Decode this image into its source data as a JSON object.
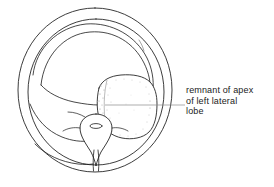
{
  "figure": {
    "type": "anatomical-line-drawing",
    "background_color": "#ffffff",
    "stroke_color": "#1a1a1a",
    "leader_line_color": "#8a8a8a",
    "stipple_color": "#9a9a9a",
    "canvas": {
      "width": 274,
      "height": 187
    }
  },
  "annotation": {
    "name": "remnant-of-apex-label",
    "lines": [
      "remnant of  apex",
      "of  left  lateral",
      "lobe"
    ],
    "full_text": "remnant of apex of left lateral lobe",
    "leader_line": {
      "from_x": 185,
      "to_x": 105,
      "y": 105
    }
  },
  "shapes": {
    "outer_capsule": {
      "name": "outer-capsule-outline",
      "cx": 95,
      "cy": 90,
      "rx": 77,
      "ry": 82
    },
    "inner_capsule": {
      "name": "inner-capsule-outline",
      "cx": 95,
      "cy": 92,
      "rx": 68,
      "ry": 73
    },
    "central_orifice": {
      "name": "urethral-orifice-oval",
      "cx": 96,
      "cy": 126,
      "rx": 6,
      "ry": 2.4
    }
  }
}
